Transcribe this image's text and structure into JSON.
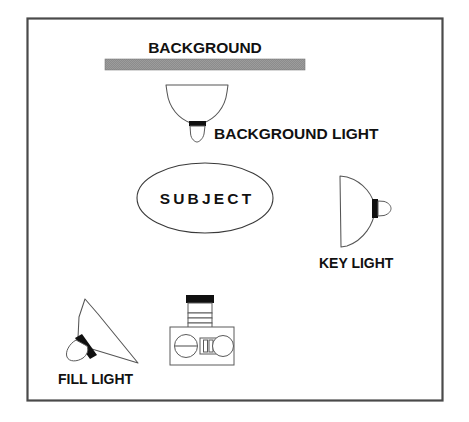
{
  "diagram": {
    "frame": {
      "name": "diagram-border"
    },
    "colors": {
      "background_bar": "#8c8c8c",
      "line": "#555555",
      "text": "#111111",
      "socket": "#101010",
      "canvas": "#ffffff"
    },
    "labels": {
      "background": "BACKGROUND",
      "background_light": "BACKGROUND LIGHT",
      "subject": "SUBJECT",
      "key_light": "KEY LIGHT",
      "fill_light": "FILL LIGHT"
    },
    "elements": [
      {
        "id": "background-bar",
        "label": "BACKGROUND",
        "kind": "backdrop-bar"
      },
      {
        "id": "background-light",
        "label": "BACKGROUND LIGHT",
        "kind": "bowl-reflector-light"
      },
      {
        "id": "subject",
        "label": "SUBJECT",
        "kind": "ellipse-marker"
      },
      {
        "id": "key-light",
        "label": "KEY LIGHT",
        "kind": "dome-reflector-light"
      },
      {
        "id": "fill-light",
        "label": "FILL LIGHT",
        "kind": "angled-reflector-light"
      },
      {
        "id": "camera",
        "label": "",
        "kind": "camera"
      }
    ]
  }
}
